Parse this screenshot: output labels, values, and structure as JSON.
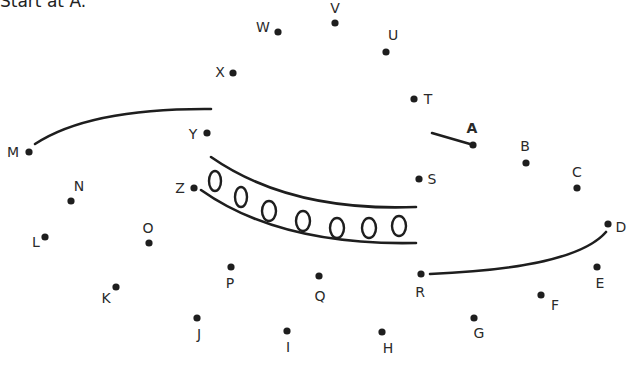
{
  "instruction": "Start at A.",
  "puzzle": {
    "type": "connect-the-dots",
    "ink_color": "#1e1e1e",
    "start_label": "A",
    "points": [
      {
        "label": "A",
        "x": 473,
        "y": 145,
        "lx": 472,
        "ly": 133,
        "bold": true
      },
      {
        "label": "B",
        "x": 526,
        "y": 163,
        "lx": 525,
        "ly": 151
      },
      {
        "label": "C",
        "x": 577,
        "y": 188,
        "lx": 577,
        "ly": 177
      },
      {
        "label": "D",
        "x": 608,
        "y": 224,
        "lx": 621,
        "ly": 232
      },
      {
        "label": "E",
        "x": 597,
        "y": 267,
        "lx": 600,
        "ly": 288
      },
      {
        "label": "F",
        "x": 541,
        "y": 295,
        "lx": 555,
        "ly": 310
      },
      {
        "label": "G",
        "x": 474,
        "y": 318,
        "lx": 479,
        "ly": 338
      },
      {
        "label": "H",
        "x": 382,
        "y": 332,
        "lx": 388,
        "ly": 353
      },
      {
        "label": "I",
        "x": 287,
        "y": 331,
        "lx": 288,
        "ly": 352
      },
      {
        "label": "J",
        "x": 197,
        "y": 318,
        "lx": 199,
        "ly": 339
      },
      {
        "label": "K",
        "x": 116,
        "y": 287,
        "lx": 106,
        "ly": 303
      },
      {
        "label": "L",
        "x": 45,
        "y": 237,
        "lx": 36,
        "ly": 247
      },
      {
        "label": "M",
        "x": 29,
        "y": 152,
        "lx": 13,
        "ly": 157
      },
      {
        "label": "N",
        "x": 71,
        "y": 201,
        "lx": 79,
        "ly": 191
      },
      {
        "label": "O",
        "x": 149,
        "y": 243,
        "lx": 148,
        "ly": 233
      },
      {
        "label": "P",
        "x": 231,
        "y": 267,
        "lx": 230,
        "ly": 288
      },
      {
        "label": "Q",
        "x": 319,
        "y": 276,
        "lx": 320,
        "ly": 301
      },
      {
        "label": "R",
        "x": 421,
        "y": 274,
        "lx": 420,
        "ly": 297
      },
      {
        "label": "S",
        "x": 419,
        "y": 179,
        "lx": 432,
        "ly": 184
      },
      {
        "label": "T",
        "x": 414,
        "y": 99,
        "lx": 428,
        "ly": 104
      },
      {
        "label": "U",
        "x": 386,
        "y": 52,
        "lx": 393,
        "ly": 40
      },
      {
        "label": "V",
        "x": 335,
        "y": 23,
        "lx": 335,
        "ly": 13
      },
      {
        "label": "W",
        "x": 278,
        "y": 32,
        "lx": 263,
        "ly": 32
      },
      {
        "label": "X",
        "x": 233,
        "y": 73,
        "lx": 220,
        "ly": 77
      },
      {
        "label": "Y",
        "x": 207,
        "y": 133,
        "lx": 193,
        "ly": 139
      },
      {
        "label": "Z",
        "x": 194,
        "y": 188,
        "lx": 180,
        "ly": 193
      }
    ],
    "pre_drawn_strokes": [
      {
        "name": "a-lead-line",
        "d": "M432,133 L470,144"
      },
      {
        "name": "m-to-y-curve",
        "d": "M35,144 Q90,108 211,109"
      },
      {
        "name": "r-to-d-curve",
        "d": "M430,274 Q575,268 606,232"
      },
      {
        "name": "band-upper-curve",
        "d": "M211,157 Q290,212 416,207"
      },
      {
        "name": "band-lower-curve",
        "d": "M201,190 Q280,246 416,243"
      }
    ],
    "band_ovals": [
      {
        "cx": 215,
        "cy": 181,
        "rx": 6,
        "ry": 10
      },
      {
        "cx": 241,
        "cy": 197,
        "rx": 6,
        "ry": 10
      },
      {
        "cx": 269,
        "cy": 211,
        "rx": 7,
        "ry": 10
      },
      {
        "cx": 303,
        "cy": 221,
        "rx": 7,
        "ry": 10
      },
      {
        "cx": 337,
        "cy": 228,
        "rx": 7,
        "ry": 10
      },
      {
        "cx": 369,
        "cy": 228,
        "rx": 7,
        "ry": 10
      },
      {
        "cx": 399,
        "cy": 226,
        "rx": 7,
        "ry": 10
      }
    ]
  }
}
